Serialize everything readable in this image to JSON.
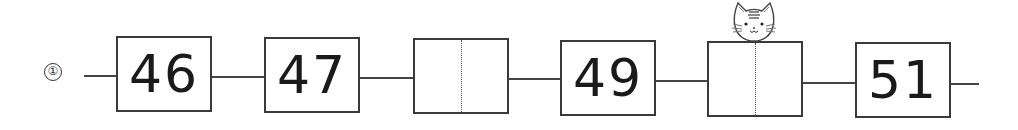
{
  "problem": {
    "label": "①",
    "sequence": [
      {
        "value": "46",
        "blank": false
      },
      {
        "value": "47",
        "blank": false
      },
      {
        "value": "",
        "blank": true
      },
      {
        "value": "49",
        "blank": false
      },
      {
        "value": "",
        "blank": true
      },
      {
        "value": "51",
        "blank": false
      }
    ]
  },
  "decoration": {
    "icon": "cat-face-icon"
  }
}
